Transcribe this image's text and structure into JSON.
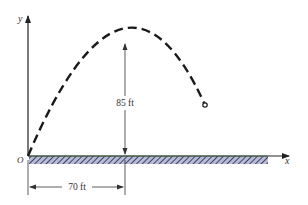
{
  "diagram": {
    "type": "projectile-trajectory",
    "axes": {
      "x_label": "x",
      "y_label": "y",
      "origin_label": "O"
    },
    "dimensions": {
      "max_height_label": "85 ft",
      "horizontal_distance_label": "70 ft"
    },
    "colors": {
      "ground_fill": "#7a7fa0",
      "ground_top_line": "#7fbf7f",
      "curve": "#1a1a1a",
      "axes": "#222222"
    }
  }
}
